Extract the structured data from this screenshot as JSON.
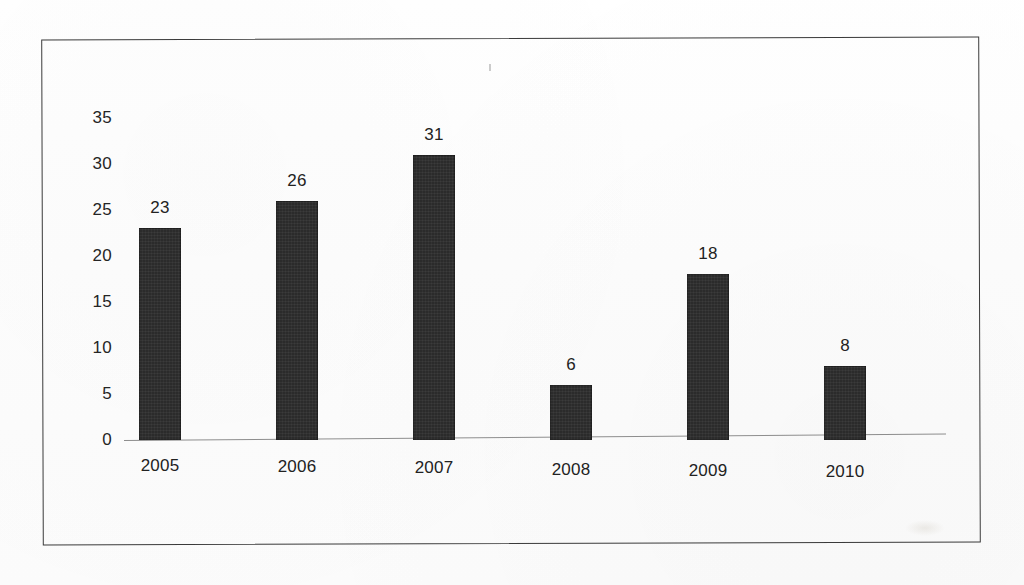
{
  "chart_data": {
    "type": "bar",
    "title": "",
    "subtitle": "",
    "xlabel": "",
    "ylabel": "",
    "categories": [
      "2005",
      "2006",
      "2007",
      "2008",
      "2009",
      "2010"
    ],
    "values": [
      23,
      26,
      31,
      6,
      18,
      8
    ],
    "data_labels": [
      "23",
      "26",
      "31",
      "6",
      "18",
      "8"
    ],
    "yticks": [
      "35",
      "30",
      "25",
      "20",
      "15",
      "10",
      "5",
      "0"
    ],
    "ytick_values": [
      35,
      30,
      25,
      20,
      15,
      10,
      5,
      0
    ],
    "ylim": [
      0,
      35
    ],
    "grid": false,
    "legend": null,
    "legend_position": "none",
    "series": [
      {
        "name": "",
        "values": [
          23,
          26,
          31,
          6,
          18,
          8
        ],
        "color": "#2b2b2b"
      }
    ],
    "annotations": []
  },
  "figure": {
    "border_color": "#3a3a3a",
    "background_color": "#ffffff",
    "axis_line_color": "#8d8d8d",
    "bar_color": "#2b2b2b",
    "text_color": "#222222"
  }
}
